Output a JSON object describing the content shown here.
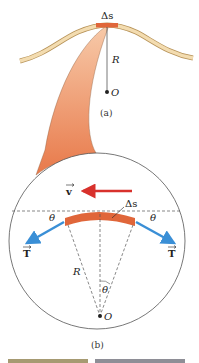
{
  "diagram": {
    "part_a": {
      "caption": "(a)",
      "segment_label": "Δs",
      "radius_label": "R",
      "center_label": "O"
    },
    "part_b": {
      "caption": "(b)",
      "velocity_label": "v",
      "segment_label": "Δs",
      "tension_left_label": "T",
      "tension_right_label": "T",
      "angle_left_label": "θ",
      "angle_right_label": "θ",
      "angle_center_label": "θ",
      "radius_label": "R",
      "center_label": "O"
    },
    "colors": {
      "string": "#f3dcb0",
      "string_outline": "#b8945a",
      "segment": "#e0663a",
      "funnel": "#ec8a5a",
      "velocity_arrow": "#d8312c",
      "tension_arrow": "#3a8fd6",
      "circle": "#555555"
    }
  }
}
